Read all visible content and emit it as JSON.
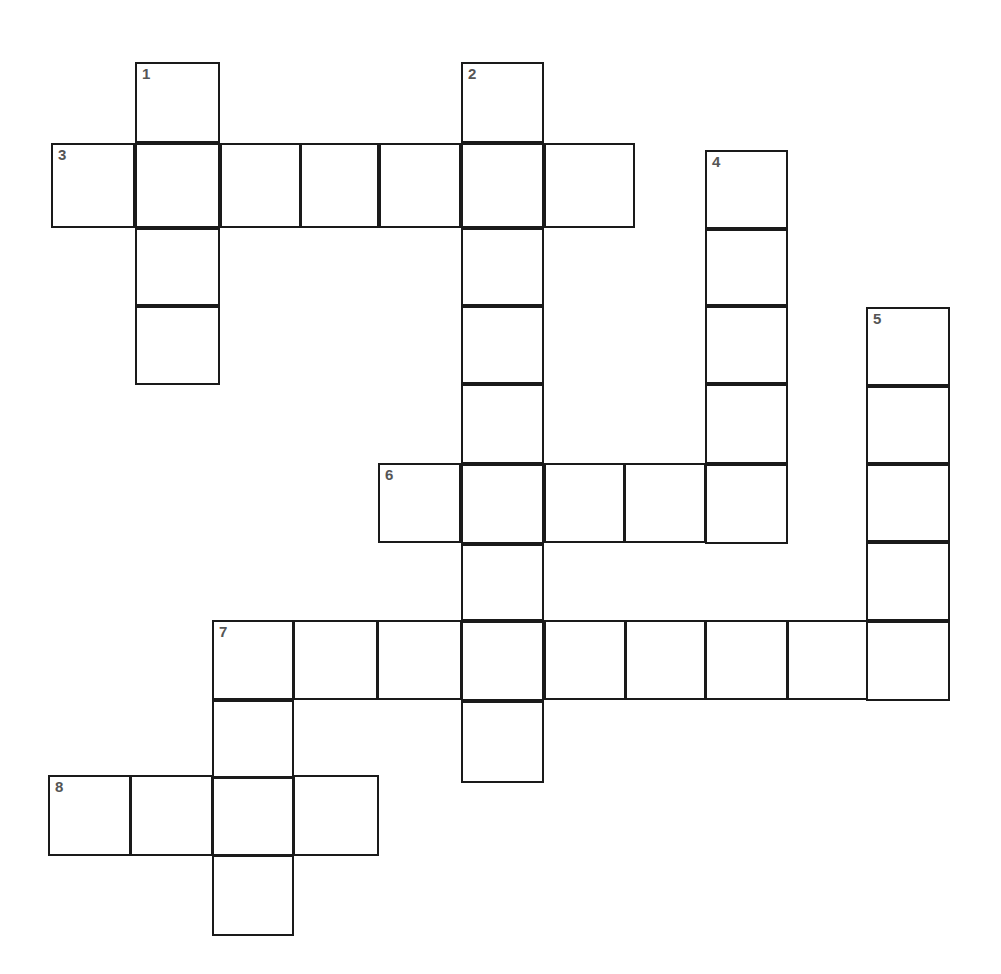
{
  "document": {
    "title": "Crossword Puzzle Grid",
    "type": "blank-crossword-grid",
    "background_color": "#ffffff",
    "line_color": "#1a1a1a",
    "number_color": "#555555",
    "canvas_width": 1001,
    "canvas_height": 974
  },
  "grid": {
    "cell_width": 83,
    "cell_height": 80,
    "column_x": [
      51,
      135,
      218,
      295,
      378,
      461,
      544,
      625,
      705,
      787,
      868,
      950
    ],
    "row_y": [
      62,
      143,
      228,
      305,
      383,
      463,
      543,
      620,
      700,
      775,
      855,
      935
    ],
    "origin_x": 51,
    "origin_y": 62
  },
  "numbers": {
    "n1": "1",
    "n2": "2",
    "n3": "3",
    "n4": "4",
    "n5": "5",
    "n6": "6",
    "n7": "7",
    "n8": "8"
  },
  "entries": [
    {
      "number": "1",
      "direction": "down",
      "length": 4,
      "start": {
        "x": 135,
        "y": 62
      },
      "cell_width": 85,
      "cell_height": 81
    },
    {
      "number": "2",
      "direction": "down",
      "length": 9,
      "start": {
        "x": 461,
        "y": 62
      },
      "cell_width": 83,
      "cell_height": 80
    },
    {
      "number": "3",
      "direction": "across",
      "length": 7,
      "start": {
        "x": 51,
        "y": 143
      },
      "cell_width": 84,
      "cell_height": 85
    },
    {
      "number": "4",
      "direction": "down",
      "length": 5,
      "start": {
        "x": 705,
        "y": 150
      },
      "cell_width": 83,
      "cell_height": 79
    },
    {
      "number": "5",
      "direction": "down",
      "length": 5,
      "start": {
        "x": 866,
        "y": 307
      },
      "cell_width": 84,
      "cell_height": 79
    },
    {
      "number": "6",
      "direction": "across",
      "length": 5,
      "start": {
        "x": 378,
        "y": 463
      },
      "cell_width": 83,
      "cell_height": 80
    },
    {
      "number": "7",
      "direction": "across",
      "length": 9,
      "start": {
        "x": 212,
        "y": 620
      },
      "cell_width": 82,
      "cell_height": 80
    },
    {
      "number": "7",
      "direction": "down",
      "length": 4,
      "start": {
        "x": 212,
        "y": 620
      },
      "cell_width": 82,
      "cell_height": 78
    },
    {
      "number": "8",
      "direction": "across",
      "length": 4,
      "start": {
        "x": 48,
        "y": 775
      },
      "cell_width": 83,
      "cell_height": 80
    }
  ],
  "cells": [
    {
      "id": "c-1-1",
      "x": 135,
      "y": 62,
      "w": 85,
      "h": 81,
      "number": "1",
      "letter": ""
    },
    {
      "id": "c-1-2",
      "x": 135,
      "y": 143,
      "w": 85,
      "h": 85,
      "number": "",
      "letter": ""
    },
    {
      "id": "c-1-3",
      "x": 135,
      "y": 228,
      "w": 85,
      "h": 78,
      "number": "",
      "letter": ""
    },
    {
      "id": "c-1-4",
      "x": 135,
      "y": 306,
      "w": 85,
      "h": 79,
      "number": "",
      "letter": ""
    },
    {
      "id": "c-2-1",
      "x": 461,
      "y": 62,
      "w": 83,
      "h": 81,
      "number": "2",
      "letter": ""
    },
    {
      "id": "c-2-2",
      "x": 461,
      "y": 143,
      "w": 83,
      "h": 85,
      "number": "",
      "letter": ""
    },
    {
      "id": "c-2-3",
      "x": 461,
      "y": 228,
      "w": 83,
      "h": 78,
      "number": "",
      "letter": ""
    },
    {
      "id": "c-2-4",
      "x": 461,
      "y": 306,
      "w": 83,
      "h": 78,
      "number": "",
      "letter": ""
    },
    {
      "id": "c-2-5",
      "x": 461,
      "y": 384,
      "w": 83,
      "h": 80,
      "number": "",
      "letter": ""
    },
    {
      "id": "c-2-6",
      "x": 461,
      "y": 464,
      "w": 83,
      "h": 80,
      "number": "",
      "letter": ""
    },
    {
      "id": "c-2-7",
      "x": 461,
      "y": 544,
      "w": 83,
      "h": 77,
      "number": "",
      "letter": ""
    },
    {
      "id": "c-2-8",
      "x": 461,
      "y": 621,
      "w": 83,
      "h": 80,
      "number": "",
      "letter": ""
    },
    {
      "id": "c-2-9",
      "x": 461,
      "y": 701,
      "w": 83,
      "h": 82,
      "number": "",
      "letter": ""
    },
    {
      "id": "c-3-1",
      "x": 51,
      "y": 143,
      "w": 84,
      "h": 85,
      "number": "3",
      "letter": ""
    },
    {
      "id": "c-3-3",
      "x": 220,
      "y": 143,
      "w": 81,
      "h": 85,
      "number": "",
      "letter": ""
    },
    {
      "id": "c-3-4",
      "x": 300,
      "y": 143,
      "w": 79,
      "h": 85,
      "number": "",
      "letter": ""
    },
    {
      "id": "c-3-5",
      "x": 379,
      "y": 143,
      "w": 82,
      "h": 85,
      "number": "",
      "letter": ""
    },
    {
      "id": "c-3-7",
      "x": 544,
      "y": 143,
      "w": 91,
      "h": 85,
      "number": "",
      "letter": ""
    },
    {
      "id": "c-4-1",
      "x": 705,
      "y": 150,
      "w": 83,
      "h": 79,
      "number": "4",
      "letter": ""
    },
    {
      "id": "c-4-2",
      "x": 705,
      "y": 229,
      "w": 83,
      "h": 77,
      "number": "",
      "letter": ""
    },
    {
      "id": "c-4-3",
      "x": 705,
      "y": 306,
      "w": 83,
      "h": 78,
      "number": "",
      "letter": ""
    },
    {
      "id": "c-4-4",
      "x": 705,
      "y": 384,
      "w": 83,
      "h": 80,
      "number": "",
      "letter": ""
    },
    {
      "id": "c-4-5",
      "x": 705,
      "y": 464,
      "w": 83,
      "h": 80,
      "number": "",
      "letter": ""
    },
    {
      "id": "c-5-1",
      "x": 866,
      "y": 307,
      "w": 84,
      "h": 79,
      "number": "5",
      "letter": ""
    },
    {
      "id": "c-5-2",
      "x": 866,
      "y": 386,
      "w": 84,
      "h": 78,
      "number": "",
      "letter": ""
    },
    {
      "id": "c-5-3",
      "x": 866,
      "y": 464,
      "w": 84,
      "h": 78,
      "number": "",
      "letter": ""
    },
    {
      "id": "c-5-4",
      "x": 866,
      "y": 542,
      "w": 84,
      "h": 79,
      "number": "",
      "letter": ""
    },
    {
      "id": "c-5-5",
      "x": 866,
      "y": 621,
      "w": 84,
      "h": 80,
      "number": "",
      "letter": ""
    },
    {
      "id": "c-6-1",
      "x": 378,
      "y": 463,
      "w": 83,
      "h": 80,
      "number": "6",
      "letter": ""
    },
    {
      "id": "c-6-3",
      "x": 544,
      "y": 463,
      "w": 81,
      "h": 80,
      "number": "",
      "letter": ""
    },
    {
      "id": "c-6-4",
      "x": 624,
      "y": 463,
      "w": 82,
      "h": 80,
      "number": "",
      "letter": ""
    },
    {
      "id": "c-7-1",
      "x": 212,
      "y": 620,
      "w": 82,
      "h": 80,
      "number": "7",
      "letter": ""
    },
    {
      "id": "c-7-2",
      "x": 293,
      "y": 620,
      "w": 85,
      "h": 80,
      "number": "",
      "letter": ""
    },
    {
      "id": "c-7-3",
      "x": 377,
      "y": 620,
      "w": 85,
      "h": 80,
      "number": "",
      "letter": ""
    },
    {
      "id": "c-7-5",
      "x": 544,
      "y": 620,
      "w": 82,
      "h": 80,
      "number": "",
      "letter": ""
    },
    {
      "id": "c-7-6",
      "x": 625,
      "y": 620,
      "w": 81,
      "h": 80,
      "number": "",
      "letter": ""
    },
    {
      "id": "c-7-7",
      "x": 705,
      "y": 620,
      "w": 83,
      "h": 80,
      "number": "",
      "letter": ""
    },
    {
      "id": "c-7-8",
      "x": 787,
      "y": 620,
      "w": 81,
      "h": 80,
      "number": "",
      "letter": ""
    },
    {
      "id": "c-7d-2",
      "x": 212,
      "y": 700,
      "w": 82,
      "h": 78,
      "number": "",
      "letter": ""
    },
    {
      "id": "c-7d-3",
      "x": 212,
      "y": 777,
      "w": 82,
      "h": 79,
      "number": "",
      "letter": ""
    },
    {
      "id": "c-7d-4",
      "x": 212,
      "y": 855,
      "w": 82,
      "h": 81,
      "number": "",
      "letter": ""
    },
    {
      "id": "c-8-1",
      "x": 48,
      "y": 775,
      "w": 83,
      "h": 81,
      "number": "8",
      "letter": ""
    },
    {
      "id": "c-8-2",
      "x": 130,
      "y": 775,
      "w": 83,
      "h": 81,
      "number": "",
      "letter": ""
    },
    {
      "id": "c-8-4",
      "x": 293,
      "y": 775,
      "w": 86,
      "h": 81,
      "number": "",
      "letter": ""
    }
  ]
}
